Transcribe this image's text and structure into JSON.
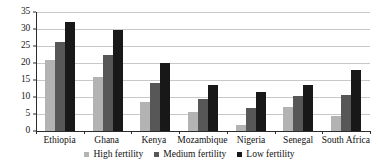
{
  "chart_data": {
    "type": "bar",
    "title": "",
    "subtitle": "",
    "xlabel": "",
    "ylabel": "",
    "ylim": [
      0,
      35
    ],
    "ytick_step": 5,
    "yticks": [
      0,
      5,
      10,
      15,
      20,
      25,
      30,
      35
    ],
    "grid": true,
    "legend_position": "bottom",
    "categories": [
      "Ethiopia",
      "Ghana",
      "Kenya",
      "Mozambique",
      "Nigeria",
      "Senegal",
      "South Africa"
    ],
    "series": [
      {
        "name": "High fertility",
        "color": "#b3b3b3",
        "values": [
          20.8,
          16.0,
          8.6,
          5.5,
          1.9,
          7.2,
          4.4
        ]
      },
      {
        "name": "Medium fertility",
        "color": "#575757",
        "values": [
          26.1,
          22.5,
          14.1,
          9.4,
          6.7,
          10.2,
          10.7
        ]
      },
      {
        "name": "Low fertility",
        "color": "#181818",
        "values": [
          32.1,
          29.7,
          20.1,
          13.6,
          11.6,
          13.5,
          17.8
        ]
      }
    ]
  },
  "colors": {
    "axis": "#2b2b2b",
    "gridline": "#c8c8c8",
    "text": "#101010",
    "background": "#ffffff",
    "series_high": "#b3b3b3",
    "series_medium": "#575757",
    "series_low": "#181818"
  }
}
